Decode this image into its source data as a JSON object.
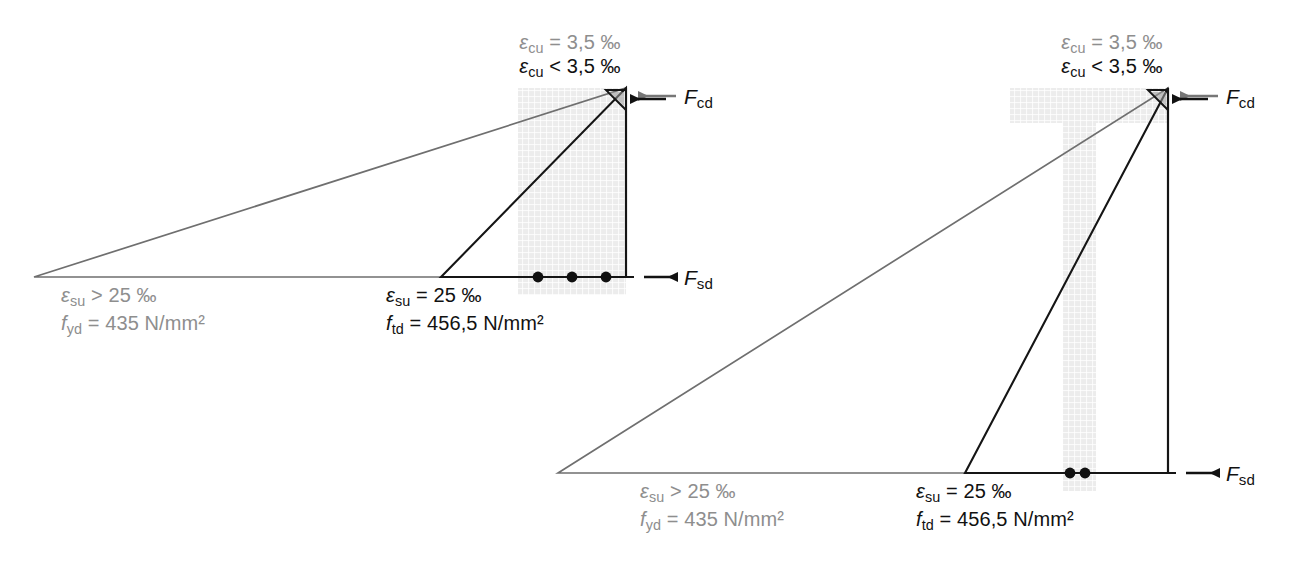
{
  "figure": {
    "colors": {
      "gray_line": "#6f6f6f",
      "black_line": "#151515",
      "gray_text": "#8e8e8e",
      "black_text": "#111111",
      "concrete_fill": "#e9e9e9",
      "background": "#ffffff"
    }
  },
  "diagrams": [
    {
      "id": "rectangular-section",
      "section_type": "rectangular",
      "rebar_count": 3,
      "labels": {
        "top_gray": {
          "symbol": "ε",
          "subscript": "cu",
          "relation": "=",
          "value": "3,5 ‰"
        },
        "top_black": {
          "symbol": "ε",
          "subscript": "cu",
          "relation": "<",
          "value": "3,5 ‰"
        },
        "bottom_gray_strain": {
          "symbol": "ε",
          "subscript": "su",
          "relation": ">",
          "value": "25 ‰"
        },
        "bottom_gray_stress": {
          "symbol": "f",
          "subscript": "yd",
          "relation": "=",
          "value": "435 N/mm²"
        },
        "bottom_black_strain": {
          "symbol": "ε",
          "subscript": "su",
          "relation": "=",
          "value": "25 ‰"
        },
        "bottom_black_stress": {
          "symbol": "f",
          "subscript": "td",
          "relation": "=",
          "value": "456,5 N/mm²"
        },
        "force_top": {
          "symbol": "F",
          "subscript": "cd"
        },
        "force_bottom": {
          "symbol": "F",
          "subscript": "sd"
        }
      }
    },
    {
      "id": "t-section",
      "section_type": "t-beam",
      "rebar_count": 2,
      "labels": {
        "top_gray": {
          "symbol": "ε",
          "subscript": "cu",
          "relation": "=",
          "value": "3,5 ‰"
        },
        "top_black": {
          "symbol": "ε",
          "subscript": "cu",
          "relation": "<",
          "value": "3,5 ‰"
        },
        "bottom_gray_strain": {
          "symbol": "ε",
          "subscript": "su",
          "relation": ">",
          "value": "25 ‰"
        },
        "bottom_gray_stress": {
          "symbol": "f",
          "subscript": "yd",
          "relation": "=",
          "value": "435 N/mm²"
        },
        "bottom_black_strain": {
          "symbol": "ε",
          "subscript": "su",
          "relation": "=",
          "value": "25 ‰"
        },
        "bottom_black_stress": {
          "symbol": "f",
          "subscript": "td",
          "relation": "=",
          "value": "456,5 N/mm²"
        },
        "force_top": {
          "symbol": "F",
          "subscript": "cd"
        },
        "force_bottom": {
          "symbol": "F",
          "subscript": "sd"
        }
      }
    }
  ]
}
